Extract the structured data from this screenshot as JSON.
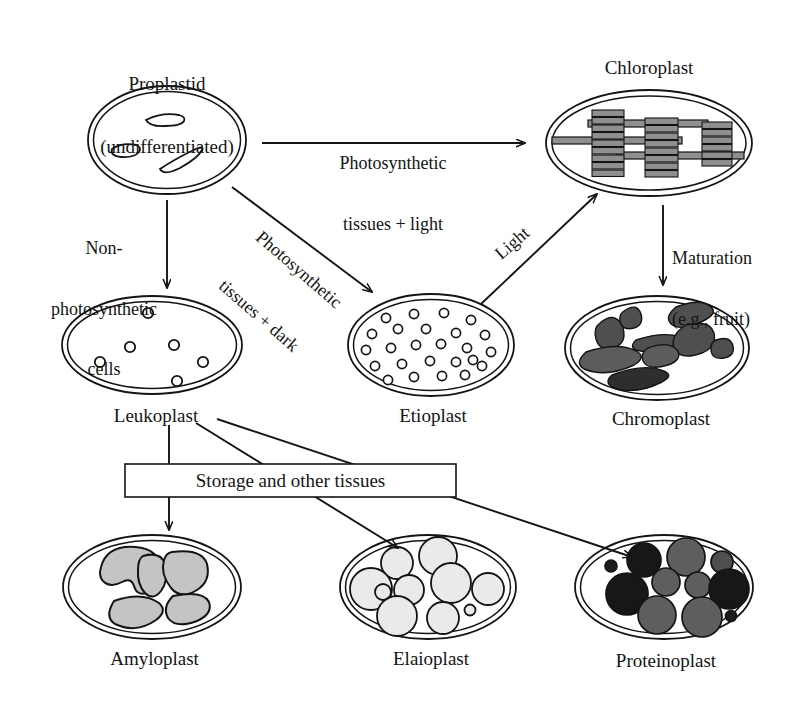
{
  "figure": {
    "title_text": "Plastid differentiation pathways",
    "background_color": "#ffffff",
    "ink_color": "#141414"
  },
  "nodes": {
    "proplastid": {
      "label": "Proplastid\n(undifferentiated)",
      "name": "Proplastid",
      "sublabel": "(undifferentiated)",
      "label_position": "above",
      "shape": "ellipse-double-membrane",
      "contents": "3 elongated white vesicles",
      "fill": "#ffffff"
    },
    "chloroplast": {
      "label": "Chloroplast",
      "label_position": "above",
      "shape": "ellipse-double-membrane",
      "contents": "3 granal stacks joined by stroma lamellae",
      "fill": "#8a8a8a"
    },
    "leukoplast": {
      "label": "Leukoplast",
      "label_position": "below",
      "shape": "ellipse-double-membrane",
      "contents": "6 small open circles",
      "fill": "#ffffff"
    },
    "etioplast": {
      "label": "Etioplast",
      "label_position": "below",
      "shape": "ellipse-double-membrane",
      "contents": "many small open circles (prolamellar body)",
      "fill": "#ffffff"
    },
    "chromoplast": {
      "label": "Chromoplast",
      "label_position": "below",
      "shape": "ellipse-double-membrane",
      "contents": "dark irregular carotenoid bodies",
      "fill": "#4d4d4d"
    },
    "amyloplast": {
      "label": "Amyloplast",
      "label_position": "below",
      "shape": "ellipse-double-membrane",
      "contents": "large light-gray starch granules",
      "fill": "#c9c9c9"
    },
    "elaioplast": {
      "label": "Elaioplast",
      "label_position": "below",
      "shape": "ellipse-double-membrane",
      "contents": "round pale lipid droplets",
      "fill": "#ebebeb"
    },
    "proteinoplast": {
      "label": "Proteinoplast",
      "label_position": "below",
      "shape": "ellipse-double-membrane",
      "contents": "black and gray protein bodies",
      "fill": "#2b2b2b"
    }
  },
  "edges": {
    "proplastid_to_chloroplast": {
      "label": "Photosynthetic\ntissues + light",
      "line1": "Photosynthetic",
      "line2": "tissues + light",
      "direction": "horizontal-right"
    },
    "proplastid_to_leukoplast": {
      "label": "Non-\nphotosynthetic\ncells",
      "line1": "Non-",
      "line2": "photosynthetic",
      "line3": "cells",
      "direction": "vertical-down"
    },
    "proplastid_to_etioplast": {
      "label": "Photosynthetic\ntissues + dark",
      "line1": "Photosynthetic",
      "line2": "tissues + dark",
      "direction": "diagonal-down-right"
    },
    "etioplast_to_chloroplast": {
      "label": "Light",
      "direction": "diagonal-up-right"
    },
    "chloroplast_to_chromoplast": {
      "label": "Maturation\n(e.g., fruit)",
      "line1": "Maturation",
      "line2": "(e.g., fruit)",
      "direction": "vertical-down"
    },
    "leukoplast_to_amyloplast": {
      "label": "",
      "direction": "vertical-down"
    },
    "leukoplast_to_elaioplast": {
      "label": "",
      "direction": "diagonal-down-right"
    },
    "leukoplast_to_proteinoplast": {
      "label": "",
      "direction": "diagonal-down-right"
    }
  },
  "box": {
    "label": "Storage and other tissues"
  }
}
